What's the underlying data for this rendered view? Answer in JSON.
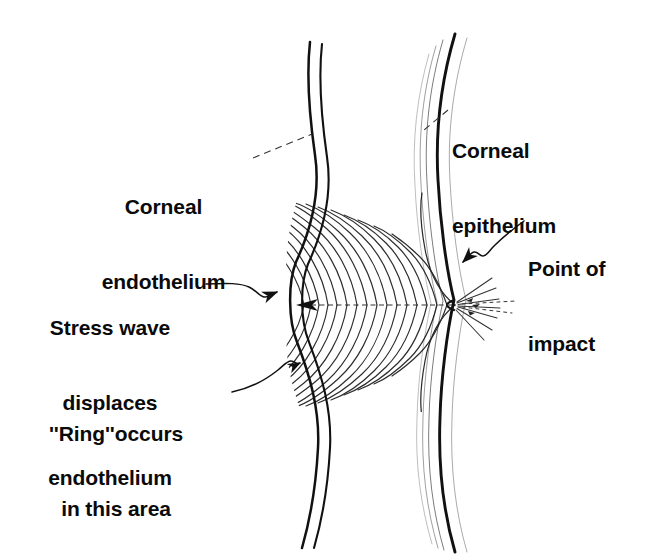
{
  "figure": {
    "background_color": "#ffffff",
    "ink_color": "#111111",
    "width": 663,
    "height": 560
  },
  "labels": {
    "corneal_endothelium": {
      "line1": "Corneal",
      "line2": "endothelium",
      "leader": "dashed-leader-line"
    },
    "corneal_epithelium": {
      "line1": "Corneal",
      "line2": "epithelium",
      "leader": "dashed-leader-line"
    },
    "stress_wave": {
      "line1": "Stress wave",
      "line2": "displaces",
      "line3": "endothelium",
      "leader": "wavy-arrow-leader"
    },
    "ring_area": {
      "line1": "''Ring''occurs",
      "line2": "in this area",
      "leader": "wavy-arrow-leader"
    },
    "point_of_impact": {
      "line1": "Point of",
      "line2": "impact",
      "leader": "wavy-arrow-leader"
    }
  },
  "anatomy": {
    "endothelium_curve": "posterior corneal surface, double line, bulged leftward at impact axis",
    "epithelium_curve": "anterior corneal surface, thick outer line with thin inner lamellae",
    "stress_wave_fan": "concentric arcs radiating leftward from point of impact to displaced endothelium",
    "impact_point": "small indentation with radiating spray lines on anterior surface",
    "axis_line": "horizontal dotted propagation axis with leftward arrowhead"
  },
  "geometry": {
    "impact_x": 455,
    "impact_y": 305,
    "axis_arrow_x": 300,
    "arc_count": 17,
    "spray_line_count": 9
  }
}
